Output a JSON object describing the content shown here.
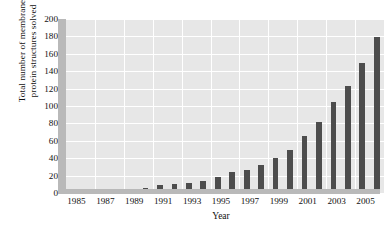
{
  "chart_data": {
    "type": "bar",
    "title": "",
    "xlabel": "Year",
    "ylabel_lines": [
      "Total number of membrane",
      "protein structures solved"
    ],
    "ylabel": "Total number of membrane protein structures solved",
    "categories": [
      1985,
      1986,
      1987,
      1988,
      1989,
      1990,
      1991,
      1992,
      1993,
      1994,
      1995,
      1996,
      1997,
      1998,
      1999,
      2000,
      2001,
      2002,
      2003,
      2004,
      2005,
      2006
    ],
    "values": [
      3,
      4,
      4,
      5,
      5,
      6,
      9,
      10,
      11,
      14,
      18,
      24,
      26,
      32,
      40,
      50,
      66,
      82,
      105,
      123,
      150,
      179
    ],
    "ylim": [
      0,
      200
    ],
    "ytick_values": [
      0,
      20,
      40,
      60,
      80,
      100,
      120,
      140,
      160,
      180,
      200
    ],
    "ytick_labels": [
      "0",
      "20",
      "40",
      "60",
      "80",
      "100",
      "120",
      "140",
      "160",
      "180",
      "200"
    ],
    "xtick_values": [
      1985,
      1987,
      1989,
      1991,
      1993,
      1995,
      1997,
      1999,
      2001,
      2003,
      2005
    ],
    "xtick_labels": [
      "1985",
      "1987",
      "1989",
      "1991",
      "1993",
      "1995",
      "1997",
      "1999",
      "2001",
      "2003",
      "2005"
    ],
    "grid": true,
    "legend": null,
    "bar_color": "#4d4d4d",
    "plot_background": "#e7e7e7",
    "grid_color": "#ffffff",
    "axis_color": "#b9b9b9",
    "figure_background": "#ffffff"
  }
}
